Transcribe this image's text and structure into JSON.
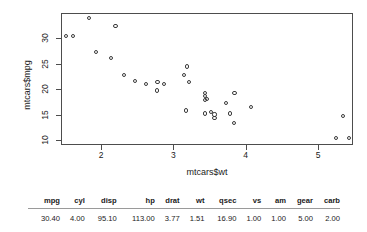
{
  "chart_data": {
    "type": "scatter",
    "title": "",
    "xlabel": "mtcars$wt",
    "ylabel": "mtcars$mpg",
    "xlim": [
      1.38,
      5.42
    ],
    "ylim": [
      10.4,
      33.9
    ],
    "xticks": [
      2,
      3,
      4,
      5
    ],
    "yticks": [
      10,
      15,
      20,
      25,
      30
    ],
    "grid": false,
    "legend": "none",
    "x": [
      2.62,
      2.875,
      2.32,
      3.215,
      3.44,
      3.46,
      3.57,
      3.19,
      3.15,
      3.44,
      3.44,
      4.07,
      3.73,
      3.78,
      5.25,
      5.424,
      5.345,
      2.2,
      1.615,
      1.835,
      2.465,
      3.52,
      3.435,
      3.84,
      3.845,
      1.935,
      2.14,
      1.513,
      3.17,
      2.77,
      3.57,
      2.78
    ],
    "y": [
      21.0,
      21.0,
      22.8,
      21.4,
      18.7,
      18.1,
      14.3,
      24.4,
      22.8,
      19.2,
      17.8,
      16.4,
      17.3,
      15.2,
      10.4,
      10.4,
      14.7,
      32.4,
      30.4,
      33.9,
      21.5,
      15.5,
      15.2,
      13.3,
      19.2,
      27.3,
      26.0,
      30.4,
      15.8,
      19.7,
      15.0,
      21.4
    ]
  },
  "table": {
    "headers": [
      "mpg",
      "cyl",
      "disp",
      "hp",
      "drat",
      "wt",
      "qsec",
      "vs",
      "am",
      "gear",
      "carb"
    ],
    "rows": [
      [
        "30.40",
        "4.00",
        "95.10",
        "113.00",
        "3.77",
        "1.51",
        "16.90",
        "1.00",
        "1.00",
        "5.00",
        "2.00"
      ]
    ]
  }
}
